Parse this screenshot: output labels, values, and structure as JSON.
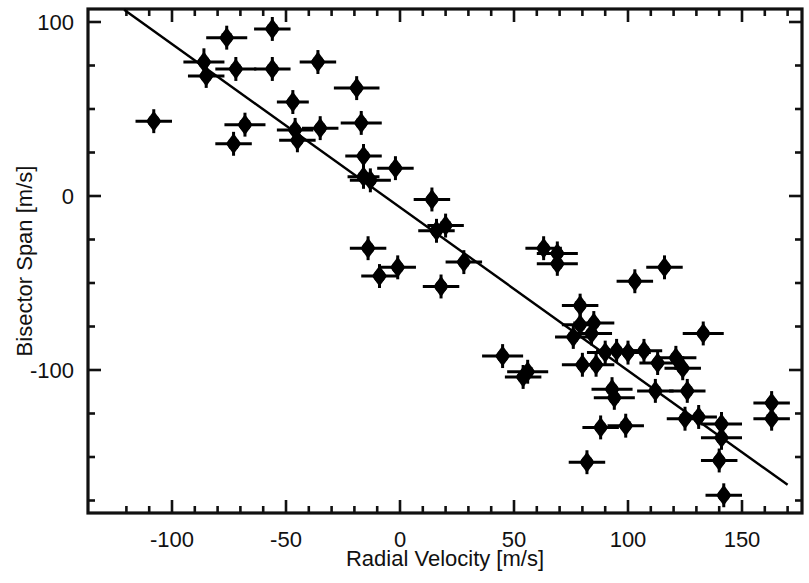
{
  "chart_data": {
    "type": "scatter",
    "title": "",
    "xlabel": "Radial Velocity [m/s]",
    "ylabel": "Bisector Span [m/s]",
    "xlim": [
      -122,
      172
    ],
    "ylim": [
      -178,
      114
    ],
    "grid": false,
    "legend": null,
    "x_major_ticks": [
      -100,
      -50,
      0,
      50,
      100,
      150
    ],
    "x_tick_labels": [
      "-100",
      "-50",
      "0",
      "50",
      "100",
      "150"
    ],
    "x_minor_interval": 10,
    "y_major_ticks": [
      100,
      0,
      -100
    ],
    "y_tick_labels": [
      "100",
      "0",
      "-100"
    ],
    "y_minor_interval": 25,
    "marker": "filled-diamond-circle",
    "marker_color": "#000000",
    "errorbars": "horizontal-and-vertical",
    "fit_line": {
      "label": "linear fit",
      "x_start": -121,
      "y_start": 107,
      "x_end": 170,
      "y_end": -166,
      "slope": -0.94,
      "intercept": -6.5,
      "color": "#000000"
    },
    "points": [
      {
        "x": -108,
        "y": 43,
        "xerr": 8,
        "yerr": 4
      },
      {
        "x": -86,
        "y": 77,
        "xerr": 9,
        "yerr": 5
      },
      {
        "x": -85,
        "y": 69,
        "xerr": 8,
        "yerr": 4
      },
      {
        "x": -76,
        "y": 91,
        "xerr": 9,
        "yerr": 4
      },
      {
        "x": -72,
        "y": 73,
        "xerr": 9,
        "yerr": 4
      },
      {
        "x": -73,
        "y": 30,
        "xerr": 8,
        "yerr": 4
      },
      {
        "x": -68,
        "y": 41,
        "xerr": 9,
        "yerr": 4
      },
      {
        "x": -56,
        "y": 96,
        "xerr": 8,
        "yerr": 4
      },
      {
        "x": -56,
        "y": 73,
        "xerr": 8,
        "yerr": 4
      },
      {
        "x": -47,
        "y": 54,
        "xerr": 7,
        "yerr": 4
      },
      {
        "x": -46,
        "y": 38,
        "xerr": 8,
        "yerr": 4
      },
      {
        "x": -45,
        "y": 32,
        "xerr": 8,
        "yerr": 4
      },
      {
        "x": -36,
        "y": 77,
        "xerr": 8,
        "yerr": 4
      },
      {
        "x": -35,
        "y": 39,
        "xerr": 8,
        "yerr": 4
      },
      {
        "x": -19,
        "y": 62,
        "xerr": 10,
        "yerr": 4
      },
      {
        "x": -17,
        "y": 42,
        "xerr": 9,
        "yerr": 4
      },
      {
        "x": -16,
        "y": 23,
        "xerr": 8,
        "yerr": 4
      },
      {
        "x": -16,
        "y": 11,
        "xerr": 7,
        "yerr": 4
      },
      {
        "x": -13,
        "y": 9,
        "xerr": 9,
        "yerr": 4
      },
      {
        "x": -14,
        "y": -30,
        "xerr": 8,
        "yerr": 4
      },
      {
        "x": -9,
        "y": -46,
        "xerr": 8,
        "yerr": 4
      },
      {
        "x": -2,
        "y": 16,
        "xerr": 8,
        "yerr": 4
      },
      {
        "x": -1,
        "y": -41,
        "xerr": 8,
        "yerr": 4
      },
      {
        "x": 14,
        "y": -2,
        "xerr": 8,
        "yerr": 4
      },
      {
        "x": 16,
        "y": -20,
        "xerr": 8,
        "yerr": 4
      },
      {
        "x": 20,
        "y": -17,
        "xerr": 8,
        "yerr": 4
      },
      {
        "x": 18,
        "y": -52,
        "xerr": 8,
        "yerr": 4
      },
      {
        "x": 28,
        "y": -38,
        "xerr": 8,
        "yerr": 4
      },
      {
        "x": 45,
        "y": -92,
        "xerr": 9,
        "yerr": 4
      },
      {
        "x": 54,
        "y": -104,
        "xerr": 8,
        "yerr": 4
      },
      {
        "x": 56,
        "y": -101,
        "xerr": 9,
        "yerr": 4
      },
      {
        "x": 63,
        "y": -30,
        "xerr": 8,
        "yerr": 4
      },
      {
        "x": 69,
        "y": -33,
        "xerr": 9,
        "yerr": 4
      },
      {
        "x": 69,
        "y": -39,
        "xerr": 9,
        "yerr": 4
      },
      {
        "x": 79,
        "y": -63,
        "xerr": 8,
        "yerr": 4
      },
      {
        "x": 79,
        "y": -74,
        "xerr": 8,
        "yerr": 4
      },
      {
        "x": 76,
        "y": -81,
        "xerr": 8,
        "yerr": 4
      },
      {
        "x": 84,
        "y": -79,
        "xerr": 9,
        "yerr": 4
      },
      {
        "x": 86,
        "y": -97,
        "xerr": 8,
        "yerr": 4
      },
      {
        "x": 80,
        "y": -97,
        "xerr": 9,
        "yerr": 4
      },
      {
        "x": 85,
        "y": -73,
        "xerr": 9,
        "yerr": 4
      },
      {
        "x": 90,
        "y": -90,
        "xerr": 8,
        "yerr": 4
      },
      {
        "x": 95,
        "y": -89,
        "xerr": 9,
        "yerr": 4
      },
      {
        "x": 93,
        "y": -111,
        "xerr": 9,
        "yerr": 4
      },
      {
        "x": 94,
        "y": -116,
        "xerr": 9,
        "yerr": 4
      },
      {
        "x": 88,
        "y": -133,
        "xerr": 8,
        "yerr": 4
      },
      {
        "x": 82,
        "y": -153,
        "xerr": 8,
        "yerr": 4
      },
      {
        "x": 100,
        "y": -90,
        "xerr": 10,
        "yerr": 4
      },
      {
        "x": 103,
        "y": -49,
        "xerr": 8,
        "yerr": 4
      },
      {
        "x": 107,
        "y": -89,
        "xerr": 8,
        "yerr": 4
      },
      {
        "x": 99,
        "y": -132,
        "xerr": 8,
        "yerr": 4
      },
      {
        "x": 116,
        "y": -41,
        "xerr": 8,
        "yerr": 4
      },
      {
        "x": 113,
        "y": -96,
        "xerr": 8,
        "yerr": 4
      },
      {
        "x": 112,
        "y": -112,
        "xerr": 8,
        "yerr": 4
      },
      {
        "x": 121,
        "y": -93,
        "xerr": 9,
        "yerr": 4
      },
      {
        "x": 124,
        "y": -99,
        "xerr": 8,
        "yerr": 4
      },
      {
        "x": 126,
        "y": -112,
        "xerr": 8,
        "yerr": 4
      },
      {
        "x": 125,
        "y": -128,
        "xerr": 8,
        "yerr": 4
      },
      {
        "x": 131,
        "y": -127,
        "xerr": 8,
        "yerr": 4
      },
      {
        "x": 133,
        "y": -79,
        "xerr": 9,
        "yerr": 4
      },
      {
        "x": 141,
        "y": -131,
        "xerr": 9,
        "yerr": 4
      },
      {
        "x": 141,
        "y": -139,
        "xerr": 9,
        "yerr": 4
      },
      {
        "x": 140,
        "y": -152,
        "xerr": 8,
        "yerr": 4
      },
      {
        "x": 142,
        "y": -172,
        "xerr": 8,
        "yerr": 4
      },
      {
        "x": 163,
        "y": -119,
        "xerr": 8,
        "yerr": 4
      },
      {
        "x": 163,
        "y": -128,
        "xerr": 8,
        "yerr": 4
      }
    ]
  }
}
